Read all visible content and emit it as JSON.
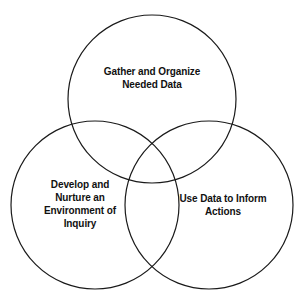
{
  "diagram": {
    "type": "venn",
    "title": "",
    "background_color": "#ffffff",
    "stroke_color": "#1a1a1a",
    "text_color": "#111111",
    "sets": [
      {
        "id": "gather",
        "position": "top",
        "label": "Gather and Organize\nNeeded Data",
        "cx": 152,
        "cy": 99,
        "r": 84
      },
      {
        "id": "develop",
        "position": "bottom-left",
        "label": "Develop and\nNurture an\nEnvironment of\nInquiry",
        "cx": 95,
        "cy": 205,
        "r": 84
      },
      {
        "id": "use",
        "position": "bottom-right",
        "label": "Use Data to Inform\nActions",
        "cx": 209,
        "cy": 205,
        "r": 84
      }
    ]
  }
}
